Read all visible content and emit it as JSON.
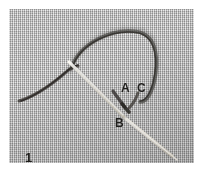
{
  "figure": {
    "number": "1",
    "medium": "needle and thread on woven fabric",
    "labels": [
      {
        "id": "A",
        "text": "A",
        "x": 116,
        "y": 79
      },
      {
        "id": "C",
        "text": "C",
        "x": 132,
        "y": 79
      },
      {
        "id": "B",
        "text": "B",
        "x": 110,
        "y": 114
      }
    ],
    "colors": {
      "page_background": "#ffffff",
      "fabric_base": "#bdbdbd",
      "fabric_light_weave": "#e2e2e2",
      "fabric_dark_weave": "#8e8e8e",
      "thread": "#3b3734",
      "needle_highlight": "#f2efe6",
      "label_text": "#201f1d"
    },
    "photo_frame": {
      "x": 9,
      "y": 9,
      "width": 185,
      "height": 154
    }
  }
}
